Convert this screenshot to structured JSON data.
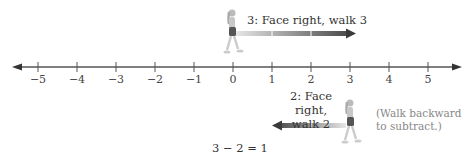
{
  "number_line": {
    "ticks": [
      "−5",
      "−4",
      "−3",
      "−2",
      "−1",
      "0",
      "1",
      "2",
      "3",
      "4",
      "5"
    ],
    "tick_x": [
      38,
      77,
      116,
      155,
      194,
      233,
      272,
      311,
      350,
      389,
      428
    ],
    "axis_color": "#555555"
  },
  "step1": {
    "label": "3: Face right, walk 3",
    "direction": "right",
    "from": 0,
    "to": 3,
    "arrow_color": "#555555"
  },
  "step2": {
    "label_line1": "2: Face right,",
    "label_line2": "walk 2",
    "direction": "backward",
    "from": 3,
    "to": 1,
    "arrow_color": "#555555"
  },
  "note": {
    "line1": "(Walk backward",
    "line2": "to subtract.)"
  },
  "equation": "3 − 2 = 1"
}
